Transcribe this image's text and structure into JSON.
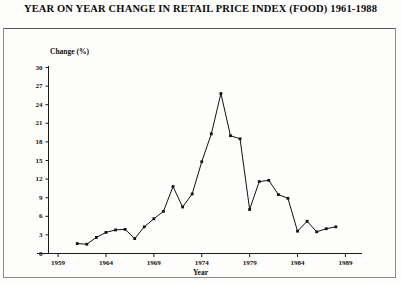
{
  "title": "YEAR ON YEAR CHANGE IN RETAIL PRICE INDEX (FOOD) 1961-1988",
  "chart_data": {
    "type": "line",
    "title": "YEAR ON YEAR CHANGE IN RETAIL PRICE INDEX (FOOD) 1961-1988",
    "xlabel": "Year",
    "ylabel": "Change (%)",
    "xlim": [
      1958,
      1990
    ],
    "ylim": [
      0,
      30
    ],
    "grid": false,
    "legend": "none",
    "markers": "filled-square",
    "xticks": [
      1959,
      1964,
      1969,
      1974,
      1979,
      1984,
      1989
    ],
    "xtick_labels": [
      "1959",
      "1964",
      "1969",
      "1974",
      "1979",
      "1984",
      "1989"
    ],
    "yticks": [
      0,
      3,
      6,
      9,
      12,
      15,
      18,
      21,
      24,
      27,
      30
    ],
    "ytick_labels": [
      "0",
      "3",
      "6",
      "9",
      "12",
      "15",
      "18",
      "21",
      "24",
      "27",
      "30"
    ],
    "x": [
      1961,
      1962,
      1963,
      1964,
      1965,
      1966,
      1967,
      1968,
      1969,
      1970,
      1971,
      1972,
      1973,
      1974,
      1975,
      1976,
      1977,
      1978,
      1979,
      1980,
      1981,
      1982,
      1983,
      1984,
      1985,
      1986,
      1987,
      1988
    ],
    "values": [
      1.6,
      1.5,
      2.6,
      3.4,
      3.8,
      3.9,
      2.4,
      4.3,
      5.6,
      6.8,
      10.8,
      7.5,
      9.6,
      14.8,
      19.3,
      25.8,
      19.0,
      18.5,
      7.1,
      11.6,
      11.8,
      9.5,
      8.9,
      3.6,
      5.2,
      3.5,
      4.0,
      4.3
    ],
    "series_name": "Year on year change in RPI (Food)"
  },
  "axes": {
    "y_title": "Change (%)",
    "x_title": "Year"
  }
}
